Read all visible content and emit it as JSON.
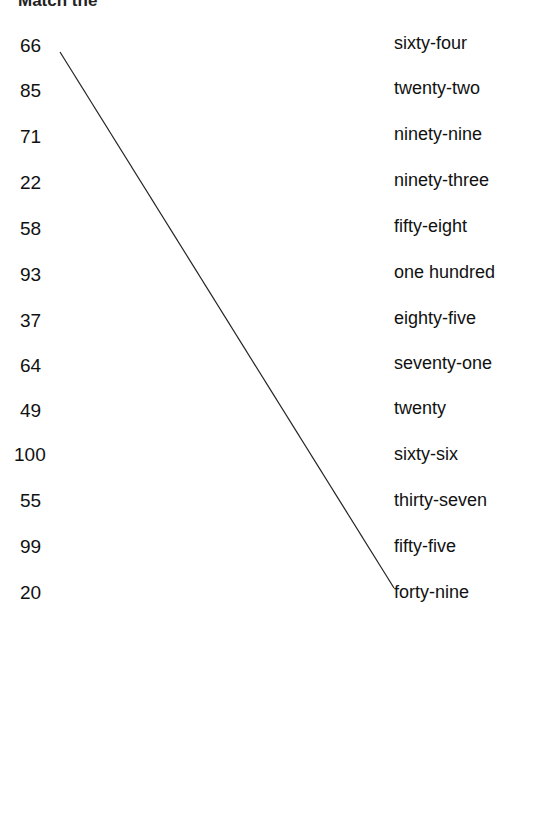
{
  "title": "Match the",
  "left": [
    "66",
    "85",
    "71",
    "22",
    "58",
    "93",
    "37",
    "64",
    "49",
    "100",
    "55",
    "99",
    "20"
  ],
  "right": [
    "sixty-four",
    "twenty-two",
    "ninety-nine",
    "ninety-three",
    "fifty-eight",
    "one hundred",
    "eighty-five",
    "seventy-one",
    "twenty",
    "sixty-six",
    "thirty-seven",
    "fifty-five",
    "forty-nine"
  ],
  "connections": [
    {
      "from": 0,
      "to": 9
    }
  ],
  "line_color": "#222222"
}
